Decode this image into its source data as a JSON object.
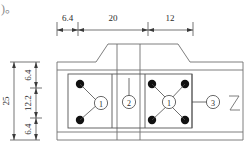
{
  "drawing": {
    "title_fragment": ")。",
    "type": "engineering-plan-detail",
    "colors": {
      "outline": "#6f6f6f",
      "inner_outline": "#555555",
      "bolt": "#111111",
      "dimension": "#3a3a3a",
      "text": "#2b2b2b",
      "fragment_text": "#8a8a8a"
    },
    "top_dimension_chain": {
      "orientation": "horizontal",
      "segments": [
        {
          "label": "6.4",
          "value": 6.4
        },
        {
          "label": "20",
          "value": 20
        },
        {
          "label": "12",
          "value": 12
        }
      ]
    },
    "left_dimension_chain": {
      "orientation": "vertical",
      "overall": {
        "label": "25",
        "value": 25
      },
      "segments": [
        {
          "label": "6.4",
          "value": 6.4
        },
        {
          "label": "12.2",
          "value": 12.2
        },
        {
          "label": "6.4",
          "value": 6.4
        }
      ]
    },
    "callouts": [
      {
        "id": "callout-1-left",
        "label": "1",
        "circled": "①",
        "leader": "v-branch-to-two-bolts"
      },
      {
        "id": "callout-2",
        "label": "2",
        "circled": "②",
        "leader": "vertical-up"
      },
      {
        "id": "callout-1-right",
        "label": "1",
        "circled": "①",
        "leader": "x-branch-to-four-bolts"
      },
      {
        "id": "callout-3",
        "label": "3",
        "circled": "③",
        "leader": "horizontal-left"
      }
    ],
    "bolts": {
      "count": 6,
      "left_group": 2,
      "right_group": 4,
      "symbol": "filled-circle"
    },
    "break_line": {
      "present": true,
      "position": "right-edge",
      "shape": "z-break"
    }
  }
}
